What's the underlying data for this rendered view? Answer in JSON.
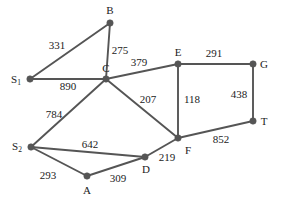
{
  "figure": {
    "kind": "weighted-undirected-graph",
    "background_color": "#ffffff",
    "edge_color": "#555555",
    "node_color": "#555555",
    "label_color": "#1b1b1b",
    "width": 290,
    "height": 202
  },
  "nodes": [
    {
      "id": "B",
      "label": "B",
      "sub": "",
      "x": 110,
      "y": 23,
      "label_x": 110,
      "label_y": 10
    },
    {
      "id": "S1",
      "label": "S",
      "sub": "1",
      "x": 30,
      "y": 79,
      "label_x": 16,
      "label_y": 79
    },
    {
      "id": "C",
      "label": "C",
      "sub": "",
      "x": 106,
      "y": 79,
      "label_x": 106,
      "label_y": 68
    },
    {
      "id": "E",
      "label": "E",
      "sub": "",
      "x": 178,
      "y": 64,
      "label_x": 178,
      "label_y": 52
    },
    {
      "id": "G",
      "label": "G",
      "sub": "",
      "x": 253,
      "y": 64,
      "label_x": 264,
      "label_y": 64
    },
    {
      "id": "T",
      "label": "T",
      "sub": "",
      "x": 253,
      "y": 121,
      "label_x": 264,
      "label_y": 121
    },
    {
      "id": "F",
      "label": "F",
      "sub": "",
      "x": 178,
      "y": 138,
      "label_x": 188,
      "label_y": 150
    },
    {
      "id": "S2",
      "label": "S",
      "sub": "2",
      "x": 31,
      "y": 147,
      "label_x": 17,
      "label_y": 146
    },
    {
      "id": "D",
      "label": "D",
      "sub": "",
      "x": 145,
      "y": 157,
      "label_x": 146,
      "label_y": 169
    },
    {
      "id": "A",
      "label": "A",
      "sub": "",
      "x": 87,
      "y": 176,
      "label_x": 87,
      "label_y": 190
    }
  ],
  "edges": [
    {
      "from": "S1",
      "to": "B",
      "weight": "331",
      "label_x": 57,
      "label_y": 45
    },
    {
      "from": "B",
      "to": "C",
      "weight": "275",
      "label_x": 120,
      "label_y": 50
    },
    {
      "from": "S1",
      "to": "C",
      "weight": "890",
      "label_x": 68,
      "label_y": 86
    },
    {
      "from": "C",
      "to": "E",
      "weight": "379",
      "label_x": 139,
      "label_y": 62
    },
    {
      "from": "E",
      "to": "G",
      "weight": "291",
      "label_x": 214,
      "label_y": 53
    },
    {
      "from": "E",
      "to": "F",
      "weight": "118",
      "label_x": 192,
      "label_y": 99
    },
    {
      "from": "G",
      "to": "T",
      "weight": "438",
      "label_x": 239,
      "label_y": 94
    },
    {
      "from": "C",
      "to": "F",
      "weight": "207",
      "label_x": 148,
      "label_y": 99
    },
    {
      "from": "C",
      "to": "S2",
      "weight": "784",
      "label_x": 54,
      "label_y": 114
    },
    {
      "from": "F",
      "to": "T",
      "weight": "852",
      "label_x": 221,
      "label_y": 139
    },
    {
      "from": "S2",
      "to": "D",
      "weight": "642",
      "label_x": 90,
      "label_y": 144
    },
    {
      "from": "D",
      "to": "F",
      "weight": "219",
      "label_x": 167,
      "label_y": 157
    },
    {
      "from": "S2",
      "to": "A",
      "weight": "293",
      "label_x": 48,
      "label_y": 175
    },
    {
      "from": "A",
      "to": "D",
      "weight": "309",
      "label_x": 118,
      "label_y": 178
    }
  ]
}
